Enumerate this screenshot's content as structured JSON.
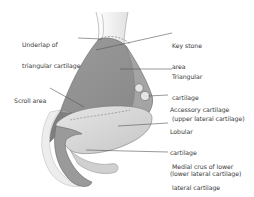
{
  "figure": {
    "labels": {
      "underlap": [
        "Underlap of",
        "triangular cartilage"
      ],
      "keystone": [
        "Key stone",
        "area"
      ],
      "triangular": [
        "Triangular",
        "cartilage",
        "(upper lateral cartilage)"
      ],
      "scroll": [
        "Scroll area"
      ],
      "accessory": [
        "Accessory cartilage"
      ],
      "lobular": [
        "Lobular",
        "cartilage",
        "(lower lateral cartilage)"
      ],
      "medial_crus": [
        "Medial crus of lower",
        "lateral cartilage"
      ]
    },
    "colors": {
      "triangular_cartilage": "#8f8f8f",
      "bone_outline": "#e8e8e8",
      "lobular_cartilage": "#d9d9d9",
      "medial_crus": "#9a9a9a",
      "lateral_crus_dark": "#7d7d7d",
      "leader_line": "#555555",
      "text": "#3a3a3a"
    }
  }
}
